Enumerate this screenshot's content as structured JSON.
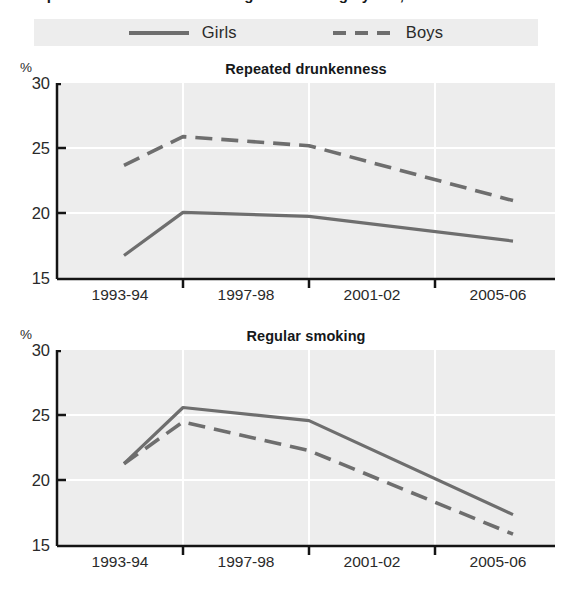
{
  "page": {
    "heading": "Repeated drunkenness and regular smoking by sex, 1993-94 to 2005-06"
  },
  "legend": {
    "entries": [
      {
        "label": "Girls",
        "style": "solid",
        "color": "#6e6e6e"
      },
      {
        "label": "Boys",
        "style": "dashed",
        "color": "#6e6e6e"
      }
    ]
  },
  "colors": {
    "line": "#6e6e6e",
    "axis": "#141414",
    "plot_background": "#ededed",
    "gridline": "#ffffff",
    "text": "#2a2a2a",
    "legend_background": "#ededed"
  },
  "charts": [
    {
      "id": "chart-drunkenness",
      "title": "Repeated drunkenness",
      "unit": "%",
      "yticks": [
        "30",
        "25",
        "20",
        "15"
      ],
      "xticks": [
        "1993-94",
        "1997-98",
        "2001-02",
        "2005-06"
      ]
    },
    {
      "id": "chart-smoking",
      "title": "Regular smoking",
      "unit": "%",
      "yticks": [
        "30",
        "25",
        "20",
        "15"
      ],
      "xticks": [
        "1993-94",
        "1997-98",
        "2001-02",
        "2005-06"
      ]
    }
  ],
  "chart_data": [
    {
      "type": "line",
      "title": "Repeated drunkenness",
      "xlabel": "",
      "ylabel": "%",
      "categories": [
        "1993-94",
        "1997-98",
        "2001-02",
        "2005-06"
      ],
      "ylim": [
        15,
        30
      ],
      "yticks": [
        15,
        20,
        25,
        30
      ],
      "grid": true,
      "legend_position": "top",
      "series": [
        {
          "name": "Girls",
          "style": "solid",
          "values": [
            16.8,
            20.1,
            19.8,
            17.9
          ]
        },
        {
          "name": "Boys",
          "style": "dashed",
          "values": [
            23.7,
            25.9,
            25.2,
            21.0
          ]
        }
      ]
    },
    {
      "type": "line",
      "title": "Regular smoking",
      "xlabel": "",
      "ylabel": "%",
      "categories": [
        "1993-94",
        "1997-98",
        "2001-02",
        "2005-06"
      ],
      "ylim": [
        15,
        30
      ],
      "yticks": [
        15,
        20,
        25,
        30
      ],
      "grid": true,
      "legend_position": "top",
      "series": [
        {
          "name": "Girls",
          "style": "solid",
          "values": [
            21.3,
            25.6,
            24.6,
            17.4
          ]
        },
        {
          "name": "Boys",
          "style": "dashed",
          "values": [
            21.3,
            24.5,
            22.3,
            15.9
          ]
        }
      ]
    }
  ]
}
